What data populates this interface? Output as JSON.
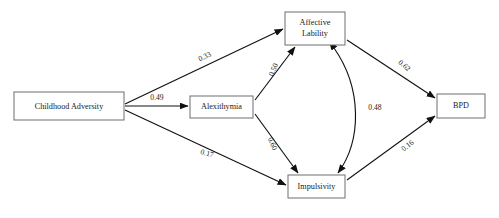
{
  "diagram": {
    "type": "path-analysis-model",
    "nodes": [
      {
        "id": "childhood_adversity",
        "label": "Childhood Adversity",
        "x": 14,
        "y": 92,
        "w": 110,
        "h": 28
      },
      {
        "id": "alexithymia",
        "label": "Alexithymia",
        "x": 190,
        "y": 96,
        "w": 63,
        "h": 22
      },
      {
        "id": "affective_lability",
        "label_line1": "Affective",
        "label_line2": "Lability",
        "x": 285,
        "y": 12,
        "w": 60,
        "h": 33
      },
      {
        "id": "impulsivity",
        "label": "Impulsivity",
        "x": 288,
        "y": 175,
        "w": 57,
        "h": 23
      },
      {
        "id": "bpd",
        "label": "BPD",
        "x": 437,
        "y": 94,
        "w": 48,
        "h": 24
      }
    ],
    "paths": [
      {
        "id": "ca-to-al",
        "from": "childhood_adversity",
        "to": "affective_lability",
        "coefficient": "0.33",
        "label_x": 205,
        "label_y": 57,
        "label_rotation": -25,
        "arrow": "single"
      },
      {
        "id": "ca-to-alex",
        "from": "childhood_adversity",
        "to": "alexithymia",
        "coefficient": "0.49",
        "label_x": 157,
        "label_y": 98,
        "label_rotation": 0,
        "arrow": "single"
      },
      {
        "id": "ca-to-imp",
        "from": "childhood_adversity",
        "to": "impulsivity",
        "coefficient": "0.17",
        "label_x": 207,
        "label_y": 154,
        "label_rotation": 14,
        "arrow": "single"
      },
      {
        "id": "alex-to-al",
        "from": "alexithymia",
        "to": "affective_lability",
        "coefficient": "0.50",
        "label_x": 274,
        "label_y": 70,
        "label_rotation": -68,
        "arrow": "single"
      },
      {
        "id": "alex-to-imp",
        "from": "alexithymia",
        "to": "impulsivity",
        "coefficient": "0.60",
        "label_x": 272,
        "label_y": 144,
        "label_rotation": 66,
        "arrow": "single"
      },
      {
        "id": "al-to-bpd",
        "from": "affective_lability",
        "to": "bpd",
        "coefficient": "0.62",
        "label_x": 404,
        "label_y": 66,
        "label_rotation": 39,
        "arrow": "single"
      },
      {
        "id": "imp-to-bpd",
        "from": "impulsivity",
        "to": "bpd",
        "coefficient": "0.16",
        "label_x": 408,
        "label_y": 146,
        "label_rotation": -38,
        "arrow": "single"
      },
      {
        "id": "al-imp-correlation",
        "from": "affective_lability",
        "to": "impulsivity",
        "coefficient": "0.48",
        "label_x": 375,
        "label_y": 108,
        "label_rotation": 0,
        "arrow": "double"
      }
    ],
    "colors": {
      "line": "#111111",
      "box_border": "#6e6e6e",
      "text": "#1a1a1a",
      "background": "#ffffff"
    }
  }
}
